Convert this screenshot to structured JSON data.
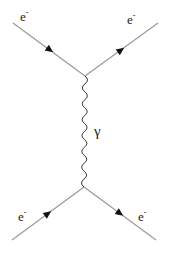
{
  "diagram": {
    "type": "feynman",
    "title": "",
    "colors": {
      "line": "#9a9a9a",
      "arrow": "#111111",
      "text": "#222222",
      "background": "#ffffff"
    },
    "vertices": [
      {
        "id": "v1",
        "x": 85,
        "y": 76
      },
      {
        "id": "v2",
        "x": 84,
        "y": 187
      }
    ],
    "fermion_lines": [
      {
        "id": "in-top",
        "from": [
          13,
          23
        ],
        "to": [
          85,
          76
        ],
        "arrow": "toward-vertex",
        "label": "e",
        "label_sup": "-",
        "label_pos": [
          20,
          21
        ]
      },
      {
        "id": "out-top",
        "from": [
          85,
          76
        ],
        "to": [
          158,
          23
        ],
        "arrow": "away-from-vertex",
        "label": "e",
        "label_sup": "-",
        "label_pos": [
          127,
          24
        ]
      },
      {
        "id": "in-bottom",
        "from": [
          12,
          240
        ],
        "to": [
          84,
          187
        ],
        "arrow": "toward-vertex",
        "label": "e",
        "label_sup": "-",
        "label_pos": [
          18,
          221
        ]
      },
      {
        "id": "out-bottom",
        "from": [
          84,
          187
        ],
        "to": [
          156,
          240
        ],
        "arrow": "away-from-vertex",
        "label": "e",
        "label_sup": "-",
        "label_pos": [
          138,
          221
        ]
      }
    ],
    "photon": {
      "from": "v1",
      "to": "v2",
      "style": "wavy",
      "label": "γ",
      "label_pos": [
        94,
        136
      ]
    }
  }
}
